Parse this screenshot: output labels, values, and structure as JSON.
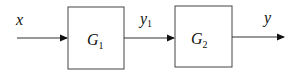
{
  "diagram": {
    "type": "block-diagram",
    "colors": {
      "stroke": "#333333",
      "text": "#111111",
      "background": "#ffffff"
    },
    "input": {
      "label": "x"
    },
    "blocks": [
      {
        "id": "G1",
        "symbol": "G",
        "subscript": "1"
      },
      {
        "id": "G2",
        "symbol": "G",
        "subscript": "2"
      }
    ],
    "signals": [
      {
        "from": "input",
        "to": "G1",
        "label": "x"
      },
      {
        "from": "G1",
        "to": "G2",
        "label": "y",
        "label_subscript": "1"
      },
      {
        "from": "G2",
        "to": "output",
        "label": "y"
      }
    ],
    "output": {
      "label": "y"
    }
  }
}
